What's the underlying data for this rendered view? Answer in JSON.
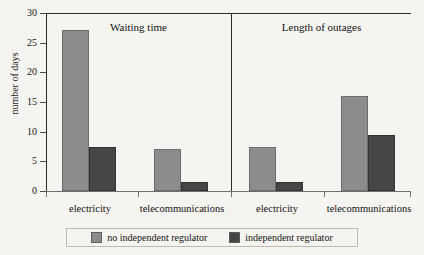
{
  "chart_data": {
    "type": "bar",
    "title": "",
    "xlabel": "",
    "ylabel": "number of days",
    "ylim": [
      0,
      30
    ],
    "yticks": [
      0,
      5,
      10,
      15,
      20,
      25,
      30
    ],
    "grid": false,
    "legend_position": "bottom",
    "panels": [
      {
        "title": "Waiting time",
        "categories": [
          "electricity",
          "telecommunications"
        ],
        "series": [
          {
            "name": "no independent regulator",
            "color": "#8c8c8c",
            "values": [
              27.1,
              7.0
            ]
          },
          {
            "name": "independent regulator",
            "color": "#464646",
            "values": [
              7.4,
              1.5
            ]
          }
        ]
      },
      {
        "title": "Length of outages",
        "categories": [
          "electricity",
          "telecommunications"
        ],
        "series": [
          {
            "name": "no independent regulator",
            "color": "#8c8c8c",
            "values": [
              7.5,
              16.0
            ]
          },
          {
            "name": "independent regulator",
            "color": "#464646",
            "values": [
              1.6,
              9.5
            ]
          }
        ]
      }
    ],
    "legend": [
      {
        "label": "no independent regulator",
        "color": "#8c8c8c"
      },
      {
        "label": "independent regulator",
        "color": "#464646"
      }
    ]
  }
}
